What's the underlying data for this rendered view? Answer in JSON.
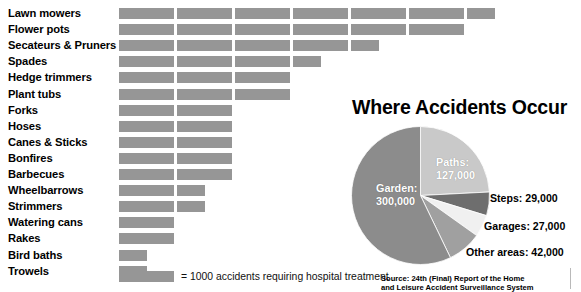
{
  "chart_data": [
    {
      "type": "bar",
      "title": "",
      "xlabel": "",
      "ylabel": "",
      "orientation": "horizontal",
      "unit_note": "= 1000 accidents requiring hospital treatment",
      "segment_unit": 1000,
      "xlim": [
        0,
        7
      ],
      "grid": false,
      "categories": [
        "Lawn mowers",
        "Flower pots",
        "Secateurs & Pruners",
        "Spades",
        "Hedge trimmers",
        "Plant tubs",
        "Forks",
        "Hoses",
        "Canes & Sticks",
        "Bonfires",
        "Barbecues",
        "Wheelbarrows",
        "Strimmers",
        "Watering cans",
        "Rakes",
        "Bird baths",
        "Trowels"
      ],
      "values": [
        6.5,
        6.0,
        4.5,
        3.5,
        3.0,
        3.0,
        2.0,
        2.0,
        2.0,
        2.0,
        2.0,
        1.5,
        1.5,
        1.0,
        1.0,
        0.5,
        0.5
      ],
      "segments": [
        [
          1,
          1,
          1,
          1,
          1,
          1,
          0.5
        ],
        [
          1,
          1,
          1,
          1,
          1,
          1
        ],
        [
          1,
          1,
          1,
          1,
          0.5
        ],
        [
          1,
          1,
          1,
          0.5
        ],
        [
          1,
          1,
          1
        ],
        [
          1,
          1,
          1
        ],
        [
          1,
          1
        ],
        [
          1,
          1
        ],
        [
          1,
          1
        ],
        [
          1,
          1
        ],
        [
          1,
          1
        ],
        [
          1,
          0.5
        ],
        [
          1,
          0.5
        ],
        [
          1
        ],
        [
          1
        ],
        [
          0.5
        ],
        [
          0.5
        ]
      ],
      "bar_color": "#969696"
    },
    {
      "type": "pie",
      "title": "Where Accidents Occur",
      "labels": [
        "Paths",
        "Steps",
        "Garages",
        "Other areas",
        "Garden"
      ],
      "values": [
        127000,
        29000,
        27000,
        42000,
        300000
      ],
      "value_text": [
        "127,000",
        "29,000",
        "27,000",
        "42,000",
        "300,000"
      ],
      "colors": [
        "#c9c9c9",
        "#6e6e6e",
        "#f0f0f0",
        "#a0a0a0",
        "#8c8c8c"
      ],
      "legend_position": "callout-labels",
      "annotations": [
        {
          "text": "Paths:",
          "value": "127,000",
          "placement": "inside"
        },
        {
          "text": "Garden:",
          "value": "300,000",
          "placement": "inside"
        },
        {
          "text": "Steps: 29,000",
          "placement": "right"
        },
        {
          "text": "Garages: 27,000",
          "placement": "right"
        },
        {
          "text": "Other areas: 42,000",
          "placement": "right"
        }
      ]
    }
  ],
  "bars": {
    "rows": [
      {
        "label": "Lawn mowers",
        "segments": [
          1,
          1,
          1,
          1,
          1,
          1,
          0.5
        ]
      },
      {
        "label": "Flower pots",
        "segments": [
          1,
          1,
          1,
          1,
          1,
          1
        ]
      },
      {
        "label": "Secateurs & Pruners",
        "segments": [
          1,
          1,
          1,
          1,
          0.5
        ]
      },
      {
        "label": "Spades",
        "segments": [
          1,
          1,
          1,
          0.5
        ]
      },
      {
        "label": "Hedge trimmers",
        "segments": [
          1,
          1,
          1
        ]
      },
      {
        "label": "Plant tubs",
        "segments": [
          1,
          1,
          1
        ]
      },
      {
        "label": "Forks",
        "segments": [
          1,
          1
        ]
      },
      {
        "label": "Hoses",
        "segments": [
          1,
          1
        ]
      },
      {
        "label": "Canes & Sticks",
        "segments": [
          1,
          1
        ]
      },
      {
        "label": "Bonfires",
        "segments": [
          1,
          1
        ]
      },
      {
        "label": "Barbecues",
        "segments": [
          1,
          1
        ]
      },
      {
        "label": "Wheelbarrows",
        "segments": [
          1,
          0.5
        ]
      },
      {
        "label": "Strimmers",
        "segments": [
          1,
          0.5
        ]
      },
      {
        "label": "Watering cans",
        "segments": [
          1
        ]
      },
      {
        "label": "Rakes",
        "segments": [
          1
        ]
      },
      {
        "label": "Bird baths",
        "segments": [
          0.5
        ]
      },
      {
        "label": "Trowels",
        "segments": [
          0.5
        ]
      }
    ]
  },
  "legend": {
    "text": "= 1000 accidents requiring hospital treatment"
  },
  "pie": {
    "title": "Where Accidents Occur",
    "slices": [
      {
        "name": "paths",
        "label": "Paths:",
        "value": "127,000",
        "color": "#c9c9c9",
        "amount": 127000
      },
      {
        "name": "steps",
        "label": "Steps:",
        "value": "29,000",
        "color": "#6e6e6e",
        "amount": 29000
      },
      {
        "name": "garages",
        "label": "Garages:",
        "value": "27,000",
        "color": "#f0f0f0",
        "amount": 27000
      },
      {
        "name": "other-areas",
        "label": "Other areas:",
        "value": "42,000",
        "color": "#a0a0a0",
        "amount": 42000
      },
      {
        "name": "garden",
        "label": "Garden:",
        "value": "300,000",
        "color": "#8c8c8c",
        "amount": 300000
      }
    ],
    "captions": {
      "paths_label": "Paths:",
      "paths_value": "127,000",
      "garden_label": "Garden:",
      "garden_value": "300,000",
      "steps": "Steps: 29,000",
      "garages": "Garages: 27,000",
      "other": "Other areas: 42,000"
    }
  },
  "source": {
    "line1": "Source: 24th (Final) Report of the Home",
    "line2": "and Leisure Accident Surveillance System"
  }
}
